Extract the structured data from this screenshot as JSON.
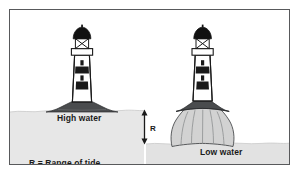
{
  "figure": {
    "labels": {
      "high_water": "High water",
      "low_water": "Low water",
      "range_marker": "R",
      "legend": "R = Range of tide"
    },
    "colors": {
      "frame_border": "#58595b",
      "background": "#ffffff",
      "water": "#e7e7e7",
      "water_low": "#e2e2e2",
      "rock_dark": "#4a4c4e",
      "rock_light": "#d2d2d2",
      "outline": "#1a1a1a",
      "band_dark": "#1a1a1a",
      "band_light": "#ffffff",
      "text": "#1a1a1a"
    },
    "scene": {
      "left_panel": {
        "name": "high-water-scene",
        "water_state": "High water",
        "visible_rock": "small dark mound only",
        "lighthouse": {
          "dome": "black half-dome lantern cap",
          "lantern": "X-braced glazed lantern room",
          "gallery": "white horizontal gallery platform",
          "tower_bands": [
            "white",
            "black",
            "white",
            "black",
            "white"
          ],
          "windows": 2
        }
      },
      "right_panel": {
        "name": "low-water-scene",
        "water_state": "Low water",
        "visible_rock": "tall exposed rock column with erosion grooves",
        "erosion_lines": 5,
        "lighthouse": {
          "dome": "black half-dome lantern cap",
          "lantern": "X-braced glazed lantern room",
          "gallery": "white horizontal gallery platform",
          "tower_bands": [
            "white",
            "black",
            "white",
            "black",
            "white"
          ],
          "windows": 2
        }
      },
      "range_arrow": {
        "name": "tidal-range-arrow",
        "style": "double-headed vertical arrow",
        "label": "R",
        "top_at": "high water line",
        "bottom_at": "low water line"
      }
    }
  }
}
